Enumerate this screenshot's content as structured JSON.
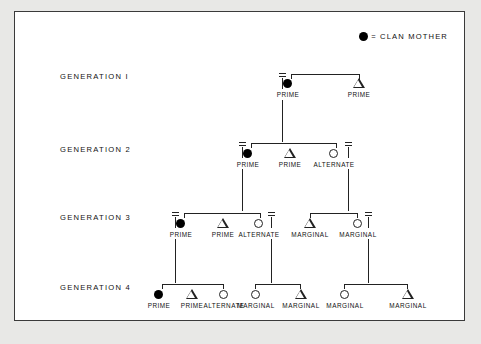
{
  "legend": {
    "symbol_icon": "filled-circle",
    "text": "= CLAN MOTHER"
  },
  "generations": [
    {
      "label": "GENERATION  I"
    },
    {
      "label": "GENERATION  2"
    },
    {
      "label": "GENERATION  3"
    },
    {
      "label": "GENERATION  4"
    }
  ],
  "nodes": {
    "g1": [
      {
        "label": "PRIME",
        "symbol": "filled-circle"
      },
      {
        "label": "PRIME",
        "symbol": "triangle"
      }
    ],
    "g2": [
      {
        "label": "PRIME",
        "symbol": "filled-circle"
      },
      {
        "label": "PRIME",
        "symbol": "triangle"
      },
      {
        "label": "ALTERNATE",
        "symbol": "open-circle"
      }
    ],
    "g3": [
      {
        "label": "PRIME",
        "symbol": "filled-circle"
      },
      {
        "label": "PRIME",
        "symbol": "triangle"
      },
      {
        "label": "ALTERNATE",
        "symbol": "open-circle"
      },
      {
        "label": "MARGINAL",
        "symbol": "triangle"
      },
      {
        "label": "MARGINAL",
        "symbol": "open-circle"
      }
    ],
    "g4": [
      {
        "label": "PRIME",
        "symbol": "filled-circle"
      },
      {
        "label": "PRIME",
        "symbol": "triangle"
      },
      {
        "label": "ALTERNATE",
        "symbol": "open-circle"
      },
      {
        "label": "MARGINAL",
        "symbol": "open-circle"
      },
      {
        "label": "MARGINAL",
        "symbol": "triangle"
      },
      {
        "label": "MARGINAL",
        "symbol": "open-circle"
      },
      {
        "label": "MARGINAL",
        "symbol": "triangle"
      }
    ]
  },
  "colors": {
    "ink": "#111111",
    "line": "#222222",
    "panel": "#ffffff",
    "page": "#e8e8e6",
    "border": "#3a3a3a"
  }
}
